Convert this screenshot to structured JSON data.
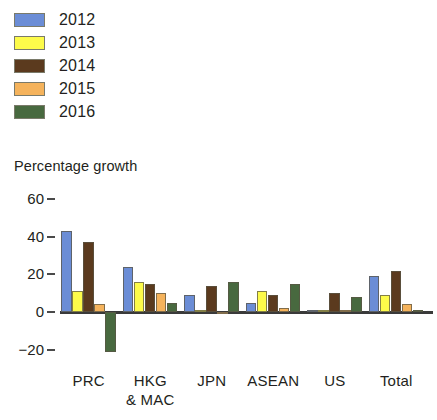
{
  "chart_data": {
    "type": "bar",
    "title": "",
    "subtitle": "",
    "xlabel": "",
    "ylabel": "Percentage growth",
    "ylim": [
      -20,
      60
    ],
    "yticks": [
      60,
      40,
      20,
      0,
      -20
    ],
    "ytick_labels": [
      "60",
      "40",
      "20",
      "0",
      "−20"
    ],
    "grid": false,
    "legend_position": "top-left",
    "categories": [
      "PRC",
      "HKG & MAC",
      "JPN",
      "ASEAN",
      "US",
      "Total"
    ],
    "category_labels": [
      {
        "line1": "PRC",
        "line2": ""
      },
      {
        "line1": "HKG",
        "line2": "& MAC"
      },
      {
        "line1": "JPN",
        "line2": ""
      },
      {
        "line1": "ASEAN",
        "line2": ""
      },
      {
        "line1": "US",
        "line2": ""
      },
      {
        "line1": "Total",
        "line2": ""
      }
    ],
    "series": [
      {
        "name": "2012",
        "color": "#6b8dd6",
        "values": [
          43,
          24,
          9,
          5,
          0.5,
          19
        ]
      },
      {
        "name": "2013",
        "color": "#fdfb4a",
        "values": [
          11,
          16,
          0.5,
          11,
          0.5,
          9
        ]
      },
      {
        "name": "2014",
        "color": "#5b3a1e",
        "values": [
          37,
          15,
          14,
          9,
          10,
          22
        ]
      },
      {
        "name": "2015",
        "color": "#f5b35c",
        "values": [
          4,
          10,
          -1,
          2,
          0.5,
          4
        ]
      },
      {
        "name": "2016",
        "color": "#48693f",
        "values": [
          -21,
          5,
          16,
          15,
          8,
          0
        ]
      }
    ]
  },
  "legend": {
    "items": [
      {
        "label": "2012",
        "color": "#6b8dd6"
      },
      {
        "label": "2013",
        "color": "#fdfb4a"
      },
      {
        "label": "2014",
        "color": "#5b3a1e"
      },
      {
        "label": "2015",
        "color": "#f5b35c"
      },
      {
        "label": "2016",
        "color": "#48693f"
      }
    ]
  }
}
